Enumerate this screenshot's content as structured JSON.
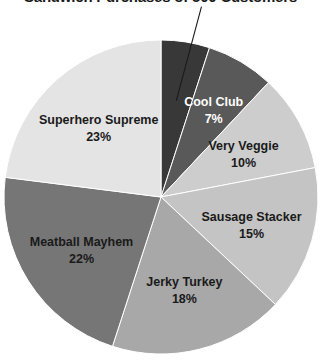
{
  "chart_data": {
    "type": "pie",
    "title": "Sandwich Purchases of 500 Customers",
    "subtitle": "",
    "xlabel": "",
    "ylabel": "",
    "grid": false,
    "legend_position": "none",
    "label_format": "name + percent",
    "start_angle_deg": 0,
    "direction": "clockwise",
    "categories": [
      "Bacon Bonanza",
      "Cool Club",
      "Very Veggie",
      "Sausage Stacker",
      "Jerky Turkey",
      "Meatball Mayhem",
      "Superhero Supreme"
    ],
    "values": [
      5,
      7,
      10,
      15,
      18,
      22,
      23
    ],
    "units": "percent",
    "total": 100,
    "slices": [
      {
        "name": "Bacon Bonanza",
        "value": 5,
        "percent_label": "5%",
        "color": "#383838",
        "label_color": "#1a1a1a",
        "label_placement": "outside",
        "has_leader_line": true
      },
      {
        "name": "Cool Club",
        "value": 7,
        "percent_label": "7%",
        "color": "#595959",
        "label_color": "#ffffff",
        "label_placement": "inside",
        "has_leader_line": false
      },
      {
        "name": "Very Veggie",
        "value": 10,
        "percent_label": "10%",
        "color": "#cdcdcd",
        "label_color": "#1a1a1a",
        "label_placement": "inside",
        "has_leader_line": false
      },
      {
        "name": "Sausage Stacker",
        "value": 15,
        "percent_label": "15%",
        "color": "#c4c4c4",
        "label_color": "#1a1a1a",
        "label_placement": "inside",
        "has_leader_line": false
      },
      {
        "name": "Jerky Turkey",
        "value": 18,
        "percent_label": "18%",
        "color": "#a8a8a8",
        "label_color": "#1a1a1a",
        "label_placement": "inside",
        "has_leader_line": false
      },
      {
        "name": "Meatball Mayhem",
        "value": 22,
        "percent_label": "22%",
        "color": "#767676",
        "label_color": "#1a1a1a",
        "label_placement": "inside",
        "has_leader_line": false
      },
      {
        "name": "Superhero Supreme",
        "value": 23,
        "percent_label": "23%",
        "color": "#e4e4e4",
        "label_color": "#1a1a1a",
        "label_placement": "inside",
        "has_leader_line": false
      }
    ],
    "geometry": {
      "center_x": 161,
      "center_y": 197,
      "radius": 157
    }
  }
}
